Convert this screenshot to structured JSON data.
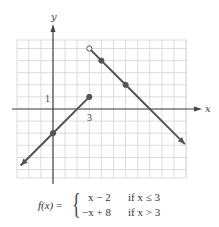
{
  "chart_data": {
    "type": "line",
    "title": "",
    "xlabel": "x",
    "ylabel": "y",
    "xlim": [
      -3,
      11
    ],
    "ylim": [
      -5.75,
      5.75
    ],
    "grid": true,
    "grid_step": 1,
    "tick_labels": [
      {
        "axis": "y",
        "value": 1,
        "label": "1"
      },
      {
        "axis": "x",
        "value": 3,
        "label": "3"
      }
    ],
    "series": [
      {
        "name": "x - 2 if x <= 3",
        "x": [
          -2.67,
          0,
          3
        ],
        "y": [
          -4.67,
          -2,
          1
        ],
        "marked_points": [
          {
            "x": 0,
            "y": -2,
            "filled": true
          },
          {
            "x": 3,
            "y": 1,
            "filled": true
          }
        ],
        "arrow_start": true
      },
      {
        "name": "-x + 8 if x > 3",
        "x": [
          3,
          4,
          6,
          10.9
        ],
        "y": [
          5,
          4,
          2,
          -2.9
        ],
        "marked_points": [
          {
            "x": 3,
            "y": 5,
            "filled": false
          },
          {
            "x": 4,
            "y": 4,
            "filled": true
          },
          {
            "x": 6,
            "y": 2,
            "filled": true
          }
        ],
        "arrow_end": true
      }
    ],
    "colors": {
      "line": "#555555",
      "grid": "#d9d9d9",
      "axis": "#444444"
    }
  },
  "labels": {
    "x_axis": "x",
    "y_axis": "y",
    "tick_y1": "1",
    "tick_x3": "3"
  },
  "formula": {
    "lhs_f": "f(x)",
    "lhs_eq": " =",
    "brace": "{",
    "case1_expr": "x − 2",
    "case1_cond": "if x ≤ 3",
    "case2_expr": "−x + 8",
    "case2_cond": "if x > 3"
  }
}
